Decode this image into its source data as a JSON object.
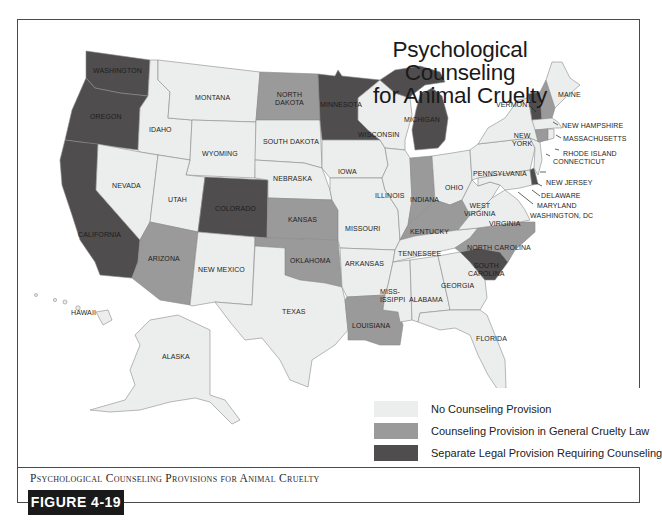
{
  "title": {
    "line1": "Psychological Counseling",
    "line2": "for Animal Cruelty"
  },
  "legend": {
    "items": [
      {
        "label": "No Counseling Provision",
        "color": "#eceeed",
        "category": "none"
      },
      {
        "label": "Counseling Provision in General Cruelty Law",
        "color": "#9a9a9a",
        "category": "general"
      },
      {
        "label": "Separate Legal Provision Requiring Counseling",
        "color": "#4f4d4e",
        "category": "separate"
      }
    ]
  },
  "colors": {
    "none": "#eceeed",
    "general": "#9a9a9a",
    "separate": "#4f4d4e",
    "border": "#4a4a4a",
    "state_border": "#8a8a8a"
  },
  "states": {
    "washington": {
      "label": "WASHINGTON",
      "category": "separate"
    },
    "oregon": {
      "label": "OREGON",
      "category": "separate"
    },
    "california": {
      "label": "CALIFORNIA",
      "category": "separate"
    },
    "idaho": {
      "label": "IDAHO",
      "category": "none"
    },
    "nevada": {
      "label": "NEVADA",
      "category": "none"
    },
    "montana": {
      "label": "MONTANA",
      "category": "none"
    },
    "wyoming": {
      "label": "WYOMING",
      "category": "none"
    },
    "utah": {
      "label": "UTAH",
      "category": "none"
    },
    "arizona": {
      "label": "ARIZONA",
      "category": "general"
    },
    "colorado": {
      "label": "COLORADO",
      "category": "separate"
    },
    "new_mexico": {
      "label": "NEW MEXICO",
      "category": "none"
    },
    "north_dakota": {
      "label": "NORTH DAKOTA",
      "line1": "NORTH",
      "line2": "DAKOTA",
      "category": "general"
    },
    "south_dakota": {
      "label": "SOUTH DAKOTA",
      "category": "none"
    },
    "nebraska": {
      "label": "NEBRASKA",
      "category": "none"
    },
    "kansas": {
      "label": "KANSAS",
      "category": "general"
    },
    "oklahoma": {
      "label": "OKLAHOMA",
      "category": "general"
    },
    "texas": {
      "label": "TEXAS",
      "category": "none"
    },
    "minnesota": {
      "label": "MINNESOTA",
      "category": "separate"
    },
    "iowa": {
      "label": "IOWA",
      "category": "none"
    },
    "missouri": {
      "label": "MISSOURI",
      "category": "none"
    },
    "arkansas": {
      "label": "ARKANSAS",
      "category": "none"
    },
    "louisiana": {
      "label": "LOUISIANA",
      "category": "general"
    },
    "wisconsin": {
      "label": "WISCONSIN",
      "category": "none"
    },
    "illinois": {
      "label": "ILLINOIS",
      "category": "none"
    },
    "michigan": {
      "label": "MICHIGAN",
      "category": "separate"
    },
    "indiana": {
      "label": "INDIANA",
      "category": "general"
    },
    "ohio": {
      "label": "OHIO",
      "category": "none"
    },
    "kentucky": {
      "label": "KENTUCKY",
      "category": "general"
    },
    "tennessee": {
      "label": "TENNESSEE",
      "category": "none"
    },
    "mississippi": {
      "label": "MISSISSIPPI",
      "line1": "MISS-",
      "line2": "ISSIPPI",
      "category": "none"
    },
    "alabama": {
      "label": "ALABAMA",
      "category": "none"
    },
    "georgia": {
      "label": "GEORGIA",
      "category": "none"
    },
    "florida": {
      "label": "FLORIDA",
      "category": "none"
    },
    "south_carolina": {
      "label": "SOUTH CAROLINA",
      "line1": "SOUTH",
      "line2": "CAROLINA",
      "category": "separate"
    },
    "north_carolina": {
      "label": "NORTH CAROLINA",
      "category": "general"
    },
    "virginia": {
      "label": "VIRGINIA",
      "category": "none"
    },
    "west_virginia": {
      "label": "WEST VIRGINIA",
      "line1": "WEST",
      "line2": "VIRGINIA",
      "category": "none"
    },
    "pennsylvania": {
      "label": "PENNSYLVANIA",
      "category": "none"
    },
    "new_york": {
      "label": "NEW YORK",
      "line1": "NEW",
      "line2": "YORK",
      "category": "none"
    },
    "vermont": {
      "label": "VERMONT",
      "category": "separate"
    },
    "new_hampshire": {
      "label": "NEW HAMPSHIRE",
      "category": "general"
    },
    "maine": {
      "label": "MAINE",
      "category": "none"
    },
    "massachusetts": {
      "label": "MASSACHUSETTS",
      "category": "none"
    },
    "rhode_island": {
      "label": "RHODE ISLAND",
      "category": "none"
    },
    "connecticut": {
      "label": "CONNECTICUT",
      "category": "general"
    },
    "new_jersey": {
      "label": "NEW JERSEY",
      "category": "none"
    },
    "delaware": {
      "label": "DELAWARE",
      "category": "separate"
    },
    "maryland": {
      "label": "MARYLAND",
      "category": "none"
    },
    "washington_dc": {
      "label": "WASHINGTON, DC",
      "category": "none"
    },
    "alaska": {
      "label": "ALASKA",
      "category": "none"
    },
    "hawaii": {
      "label": "HAWAII",
      "category": "none"
    }
  },
  "caption": "Psychological Counseling Provisions for Animal Cruelty",
  "figure_label": "FIGURE 4-19"
}
